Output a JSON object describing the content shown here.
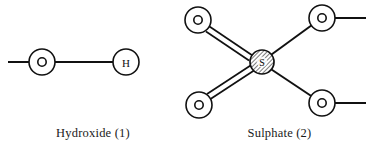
{
  "figure": {
    "background_color": "#ffffff",
    "stroke_color": "#111111",
    "text_color": "#1a1a1a"
  },
  "panels": [
    {
      "id": "hydroxide",
      "caption": "Hydroxide (1)",
      "atoms": [
        {
          "label": "O",
          "name": "oxygen-atom",
          "cx": 42,
          "cy": 62,
          "r": 13,
          "style": "ring"
        },
        {
          "label": "H",
          "name": "hydrogen-atom",
          "cx": 126,
          "cy": 62,
          "r": 13,
          "style": "plain"
        }
      ],
      "bonds": [
        {
          "name": "bond-o-h",
          "order": 1,
          "from": "O",
          "to": "H"
        },
        {
          "name": "free-bond-o-left",
          "order": 1,
          "from": "O",
          "to": "open-left"
        }
      ]
    },
    {
      "id": "sulphate",
      "caption": "Sulphate (2)",
      "atoms": [
        {
          "label": "S",
          "name": "sulphur-atom",
          "cx": 262,
          "cy": 62,
          "r": 12,
          "style": "hatched"
        },
        {
          "label": "O",
          "name": "oxygen-atom-top-left",
          "cx": 198,
          "cy": 20,
          "r": 13,
          "style": "ring"
        },
        {
          "label": "O",
          "name": "oxygen-atom-bottom-left",
          "cx": 199,
          "cy": 105,
          "r": 13,
          "style": "ring"
        },
        {
          "label": "O",
          "name": "oxygen-atom-top-right",
          "cx": 322,
          "cy": 18,
          "r": 13,
          "style": "ring"
        },
        {
          "label": "O",
          "name": "oxygen-atom-bottom-right",
          "cx": 322,
          "cy": 103,
          "r": 13,
          "style": "ring"
        }
      ],
      "bonds": [
        {
          "name": "double-bond-s-o-top-left",
          "order": 2,
          "from": "S",
          "to": "O-top-left"
        },
        {
          "name": "double-bond-s-o-bottom-left",
          "order": 2,
          "from": "S",
          "to": "O-bottom-left"
        },
        {
          "name": "single-bond-s-o-top-right",
          "order": 1,
          "from": "S",
          "to": "O-top-right"
        },
        {
          "name": "single-bond-s-o-bottom-right",
          "order": 1,
          "from": "S",
          "to": "O-bottom-right"
        },
        {
          "name": "free-bond-o-top-right",
          "order": 1,
          "from": "O-top-right",
          "to": "open-right"
        },
        {
          "name": "free-bond-o-bottom-right",
          "order": 1,
          "from": "O-bottom-right",
          "to": "open-right"
        }
      ]
    }
  ],
  "atom_labels": {
    "oxygen": "O",
    "hydrogen": "H",
    "sulphur": "S"
  }
}
